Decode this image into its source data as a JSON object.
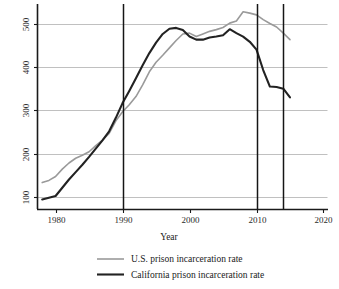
{
  "chart_data": {
    "type": "line",
    "title": "",
    "subtitle": "",
    "xlabel": "Year",
    "ylabel": "",
    "xlim": [
      1977.3,
      2020.6
    ],
    "ylim": [
      72,
      545
    ],
    "grid": "horizontal",
    "legend_position": "bottom",
    "x_ticks": [
      1980,
      1990,
      2000,
      2010,
      2020
    ],
    "x_tick_labels": [
      "1980",
      "1990",
      "2000",
      "2010",
      "2020"
    ],
    "y_ticks": [
      100,
      200,
      300,
      400,
      500
    ],
    "y_tick_labels": [
      "100",
      "200",
      "300",
      "400",
      "500"
    ],
    "y_tick_label_rotation": -90,
    "annotations": [
      {
        "type": "vline",
        "x": 1990,
        "label": "1990"
      },
      {
        "type": "vline",
        "x": 2010,
        "label": "2010"
      },
      {
        "type": "vline",
        "x": 2014,
        "label": "2014"
      }
    ],
    "series": [
      {
        "name": "U.S. prison incarceration rate",
        "color": "#9a9a9a",
        "width": 1.6,
        "x": [
          1978,
          1979,
          1980,
          1981,
          1982,
          1983,
          1984,
          1985,
          1986,
          1987,
          1988,
          1989,
          1990,
          1991,
          1992,
          1993,
          1994,
          1995,
          1996,
          1997,
          1998,
          1999,
          2000,
          2001,
          2002,
          2003,
          2004,
          2005,
          2006,
          2007,
          2008,
          2009,
          2010,
          2011,
          2012,
          2013,
          2014,
          2015
        ],
        "values": [
          134,
          139,
          148,
          165,
          179,
          190,
          197,
          205,
          219,
          232,
          247,
          276,
          297,
          313,
          332,
          359,
          389,
          411,
          427,
          444,
          461,
          476,
          478,
          470,
          476,
          482,
          486,
          491,
          501,
          506,
          527,
          524,
          520,
          509,
          500,
          492,
          478,
          463
        ]
      },
      {
        "name": "California prison incarceration rate",
        "color": "#222222",
        "width": 2.1,
        "x": [
          1978,
          1979,
          1980,
          1981,
          1982,
          1983,
          1984,
          1985,
          1986,
          1987,
          1988,
          1989,
          1990,
          1991,
          1992,
          1993,
          1994,
          1995,
          1996,
          1997,
          1998,
          1999,
          2000,
          2001,
          2002,
          2003,
          2004,
          2005,
          2006,
          2007,
          2008,
          2009,
          2010,
          2011,
          2012,
          2013,
          2014,
          2015
        ],
        "values": [
          95,
          99,
          103,
          122,
          141,
          158,
          175,
          193,
          212,
          231,
          252,
          283,
          317,
          345,
          374,
          404,
          432,
          456,
          476,
          488,
          490,
          485,
          470,
          463,
          463,
          468,
          470,
          473,
          487,
          478,
          470,
          458,
          440,
          393,
          355,
          354,
          350,
          330
        ]
      }
    ]
  },
  "axis": {
    "x_title": "Year"
  },
  "legend": {
    "entries": [
      {
        "label": "U.S. prison incarceration rate",
        "swatch_color": "#9a9a9a"
      },
      {
        "label": "California prison incarceration rate",
        "swatch_color": "#222222"
      }
    ]
  }
}
